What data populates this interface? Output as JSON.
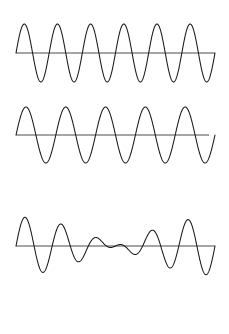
{
  "figure": {
    "background_color": "#ffffff",
    "wave_stroke_color": "#1a1a1a",
    "axis_stroke_color": "#4d4d4d",
    "stroke_width": 1.05,
    "width": 229,
    "height": 334
  },
  "chart_data": {
    "type": "line",
    "xlabel": "",
    "ylabel": "",
    "grid": false,
    "legend": "none",
    "x_range": [
      16,
      215
    ],
    "panels": [
      {
        "name": "wave-1",
        "label": "Wave 1",
        "baseline_y": 53,
        "amplitude": 29,
        "cycles": 6,
        "phase_deg": 0,
        "x_start": 16,
        "x_end": 215,
        "axis_x_start": 16,
        "axis_x_end": 215,
        "peak_y": 24,
        "trough_y": 82,
        "description": "Higher frequency sine wave, six full cycles"
      },
      {
        "name": "wave-2",
        "label": "Wave 2",
        "baseline_y": 135,
        "amplitude": 28,
        "cycles": 5,
        "phase_deg": 0,
        "x_start": 16,
        "x_end": 215,
        "axis_x_start": 16,
        "axis_x_end": 209,
        "peak_y": 107,
        "trough_y": 163,
        "description": "Lower frequency sine wave, five full cycles"
      },
      {
        "name": "wave-sum",
        "label": "Sum (beats)",
        "baseline_y": 246,
        "amplitude": 29,
        "cycles": 6,
        "cycles_b": 5,
        "phase_deg": 0,
        "x_start": 16,
        "x_end": 215,
        "axis_x_start": 16,
        "axis_x_end": 215,
        "peak_y": 188,
        "trough_y": 315,
        "description": "Superposition of wave 1 and wave 2 producing a beat envelope with a node at the centre"
      }
    ],
    "series": [
      {
        "name": "Wave 1",
        "panel": "wave-1",
        "frequency_cycles": 6,
        "amplitude": 1.0,
        "values_note": "y = A*sin(2*pi*6*t)"
      },
      {
        "name": "Wave 2",
        "panel": "wave-2",
        "frequency_cycles": 5,
        "amplitude": 1.0,
        "values_note": "y = A*sin(2*pi*5*t)"
      },
      {
        "name": "Sum (beats)",
        "panel": "wave-sum",
        "frequency_cycles": [
          6,
          5
        ],
        "amplitude": 1.0,
        "values_note": "y = A*(sin(2*pi*6*t) + sin(2*pi*5*t))/2, beat node at t = 0.5"
      }
    ]
  }
}
